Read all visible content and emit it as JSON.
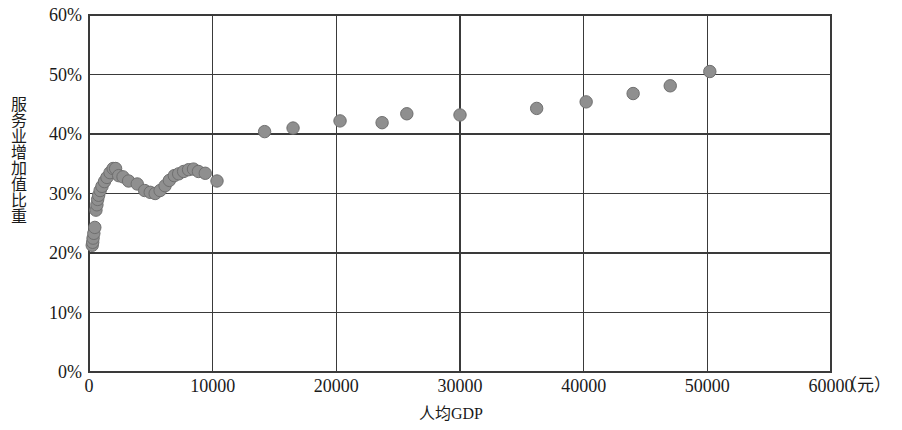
{
  "chart_data": {
    "type": "scatter",
    "title": "",
    "xlabel": "人均GDP",
    "ylabel": "服务业增加值比重",
    "x_unit": "（元）",
    "xlim": [
      0,
      60000
    ],
    "ylim": [
      0,
      0.6
    ],
    "grid": true,
    "legend": null,
    "x_ticks": [
      0,
      10000,
      20000,
      30000,
      40000,
      50000,
      60000
    ],
    "x_tick_labels": [
      "0",
      "10000",
      "20000",
      "30000",
      "40000",
      "50000",
      "60000"
    ],
    "y_ticks": [
      0,
      0.1,
      0.2,
      0.3,
      0.4,
      0.5,
      0.6
    ],
    "y_tick_labels": [
      "0%",
      "10%",
      "20%",
      "30%",
      "40%",
      "50%",
      "60%"
    ],
    "marker": {
      "shape": "circle",
      "fill": "#8f8f8f",
      "stroke": "#6f6f6f",
      "radius": 6.2
    },
    "series": [
      {
        "name": "服务业增加值比重",
        "points": [
          [
            260,
            0.213
          ],
          [
            300,
            0.218
          ],
          [
            330,
            0.225
          ],
          [
            390,
            0.233
          ],
          [
            470,
            0.243
          ],
          [
            560,
            0.272
          ],
          [
            640,
            0.281
          ],
          [
            700,
            0.29
          ],
          [
            780,
            0.297
          ],
          [
            900,
            0.305
          ],
          [
            1050,
            0.312
          ],
          [
            1250,
            0.32
          ],
          [
            1450,
            0.327
          ],
          [
            1700,
            0.335
          ],
          [
            1950,
            0.342
          ],
          [
            2150,
            0.342
          ],
          [
            2400,
            0.33
          ],
          [
            2750,
            0.328
          ],
          [
            3200,
            0.321
          ],
          [
            3900,
            0.316
          ],
          [
            4500,
            0.305
          ],
          [
            4950,
            0.302
          ],
          [
            5350,
            0.3
          ],
          [
            5750,
            0.305
          ],
          [
            6150,
            0.313
          ],
          [
            6500,
            0.322
          ],
          [
            6900,
            0.33
          ],
          [
            7250,
            0.333
          ],
          [
            7650,
            0.337
          ],
          [
            8050,
            0.34
          ],
          [
            8450,
            0.341
          ],
          [
            8850,
            0.337
          ],
          [
            9400,
            0.334
          ],
          [
            10350,
            0.321
          ],
          [
            14200,
            0.404
          ],
          [
            16500,
            0.41
          ],
          [
            20300,
            0.422
          ],
          [
            23700,
            0.419
          ],
          [
            25700,
            0.434
          ],
          [
            30000,
            0.432
          ],
          [
            36200,
            0.443
          ],
          [
            40200,
            0.454
          ],
          [
            44000,
            0.468
          ],
          [
            47000,
            0.481
          ],
          [
            50200,
            0.505
          ]
        ]
      }
    ]
  },
  "axes": {
    "plot_left_px": 89,
    "plot_right_px": 831,
    "plot_top_px": 15,
    "plot_bottom_px": 372
  },
  "colors": {
    "axis": "#3a3a3a",
    "grid": "#3a3a3a",
    "background": "#ffffff",
    "marker_fill": "#8f8f8f",
    "marker_stroke": "#6f6f6f"
  }
}
